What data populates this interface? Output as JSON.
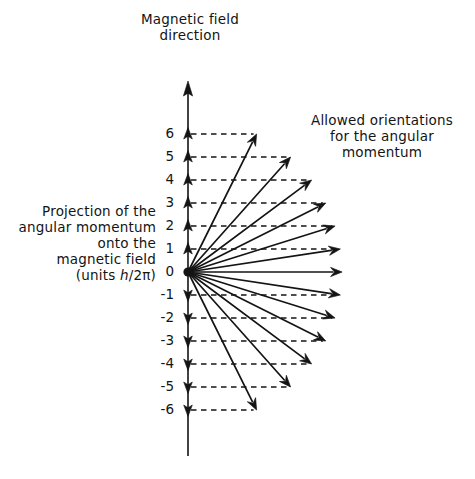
{
  "figure": {
    "title_label": "Magnetic field\ndirection",
    "right_label": "Allowed orientations\nfor the angular\nmomentum",
    "left_label_lines": "Projection of the\nangular momentum\nonto the\nmagnetic field",
    "left_label_units_prefix": "(units ",
    "left_label_units_var": "h",
    "left_label_units_suffix": "/2π)",
    "axis_name": "magnetic-field-axis",
    "colors": {
      "ink": "#141414",
      "background": "#ffffff",
      "axis": "#222222",
      "dashed": "#1a1a1a"
    }
  },
  "chart_data": {
    "type": "scatter",
    "title": "Magnetic field direction",
    "xlabel": "",
    "ylabel": "Projection of the angular momentum onto the magnetic field (units h/2π)",
    "subtitle": "Allowed orientations for the angular momentum",
    "grid": true,
    "legend_position": "none",
    "quantum_number_l": 6,
    "vector_magnitude_units": 6.7,
    "axis_tick_labels": [
      "6",
      "5",
      "4",
      "3",
      "2",
      "1",
      "0",
      "-1",
      "-2",
      "-3",
      "-4",
      "-5",
      "-6"
    ],
    "m_values": [
      6,
      5,
      4,
      3,
      2,
      1,
      0,
      -1,
      -2,
      -3,
      -4,
      -5,
      -6
    ],
    "ylim": [
      -7.5,
      8.5
    ],
    "vectors": [
      {
        "m": 6,
        "label": "6",
        "tick_direction": "up"
      },
      {
        "m": 5,
        "label": "5",
        "tick_direction": "up"
      },
      {
        "m": 4,
        "label": "4",
        "tick_direction": "up"
      },
      {
        "m": 3,
        "label": "3",
        "tick_direction": "up"
      },
      {
        "m": 2,
        "label": "2",
        "tick_direction": "up"
      },
      {
        "m": 1,
        "label": "1",
        "tick_direction": "up"
      },
      {
        "m": 0,
        "label": "0",
        "tick_direction": "none"
      },
      {
        "m": -1,
        "label": "-1",
        "tick_direction": "down"
      },
      {
        "m": -2,
        "label": "-2",
        "tick_direction": "down"
      },
      {
        "m": -3,
        "label": "-3",
        "tick_direction": "down"
      },
      {
        "m": -4,
        "label": "-4",
        "tick_direction": "down"
      },
      {
        "m": -5,
        "label": "-5",
        "tick_direction": "down"
      },
      {
        "m": -6,
        "label": "-6",
        "tick_direction": "down"
      }
    ]
  }
}
